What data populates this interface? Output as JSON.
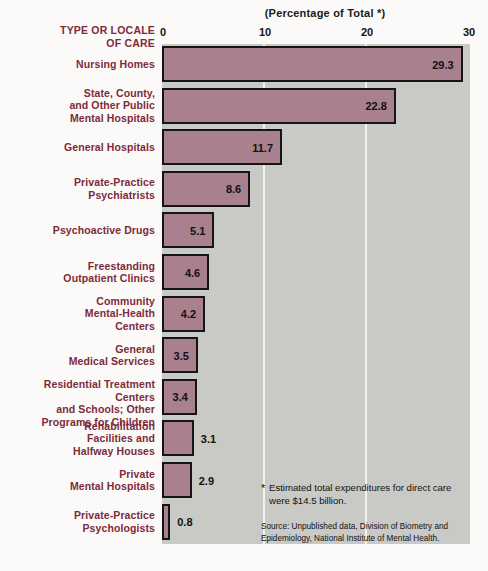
{
  "chart_data": {
    "type": "bar",
    "orientation": "horizontal",
    "title": "(Percentage of Total *)",
    "category_header": "TYPE OR LOCALE OF CARE",
    "xlabel": "",
    "ylabel": "",
    "xlim": [
      0,
      30
    ],
    "xticks": [
      0,
      10,
      20,
      30
    ],
    "xtick_labels": [
      "0",
      "10",
      "20",
      "30"
    ],
    "grid": true,
    "legend": "none",
    "categories": [
      "Nursing Homes",
      "State, County, and Other Public Mental Hospitals",
      "General Hospitals",
      "Private-Practice Psychiatrists",
      "Psychoactive Drugs",
      "Freestanding Outpatient Clinics",
      "Community Mental-Health Centers",
      "General Medical Services",
      "Residential Treatment Centers and Schools; Other Programs for Children",
      "Rehabilitation Facilities and Halfway Houses",
      "Private Mental Hospitals",
      "Private-Practice Psychologists"
    ],
    "values": [
      29.3,
      22.8,
      11.7,
      8.6,
      5.1,
      4.6,
      4.2,
      3.5,
      3.4,
      3.1,
      2.9,
      0.8
    ],
    "value_labels": [
      "29.3",
      "22.8",
      "11.7",
      "8.6",
      "5.1",
      "4.6",
      "4.2",
      "3.5",
      "3.4",
      "3.1",
      "2.9",
      "0.8"
    ],
    "bar_color": "#a9808d",
    "bar_border_color": "#151515",
    "plot_background": "#c9c9c6",
    "label_color": "#7d2a3b"
  },
  "rows": [
    {
      "label_lines": [
        "Nursing Homes"
      ],
      "value": "29.3"
    },
    {
      "label_lines": [
        "State, County,",
        "and Other Public",
        "Mental Hospitals"
      ],
      "value": "22.8"
    },
    {
      "label_lines": [
        "General Hospitals"
      ],
      "value": "11.7"
    },
    {
      "label_lines": [
        "Private-Practice",
        "Psychiatrists"
      ],
      "value": "8.6"
    },
    {
      "label_lines": [
        "Psychoactive Drugs"
      ],
      "value": "5.1"
    },
    {
      "label_lines": [
        "Freestanding",
        "Outpatient Clinics"
      ],
      "value": "4.6"
    },
    {
      "label_lines": [
        "Community",
        "Mental-Health",
        "Centers"
      ],
      "value": "4.2"
    },
    {
      "label_lines": [
        "General",
        "Medical Services"
      ],
      "value": "3.5"
    },
    {
      "label_lines": [
        "Residential Treatment Centers",
        "and Schools; Other",
        "Programs for Children"
      ],
      "value": "3.4"
    },
    {
      "label_lines": [
        "Rehabilitation",
        "Facilities and",
        "Halfway Houses"
      ],
      "value": "3.1"
    },
    {
      "label_lines": [
        "Private",
        "Mental Hospitals"
      ],
      "value": "2.9"
    },
    {
      "label_lines": [
        "Private-Practice",
        "Psychologists"
      ],
      "value": "0.8"
    }
  ],
  "notes": {
    "footnote_marker": "*",
    "footnote": "Estimated total expenditures for direct care were $14.5 billion.",
    "source": "Source: Unpublished data, Division of Biometry and Epidemiology, National Institute of  Mental Health."
  }
}
